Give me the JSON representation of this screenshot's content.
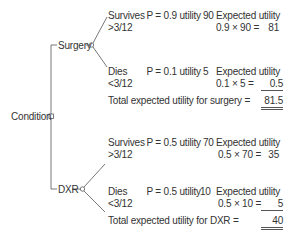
{
  "root": {
    "label": "Condition",
    "node_type": "decision-square"
  },
  "branches": [
    {
      "label": "Surgery",
      "node_type": "chance-circle",
      "outcomes": [
        {
          "label": "Survives",
          "sublabel": ">3/12",
          "probability_text": "P = 0.9 utility",
          "utility": "90",
          "eu_label": "Expected utility",
          "eu_calc": "0.9 × 90 =",
          "eu_value": "81"
        },
        {
          "label": "Dies",
          "sublabel": "<3/12",
          "probability_text": "P = 0.1 utility",
          "utility": "5",
          "eu_label": "Expected utility",
          "eu_calc": "0.1 × 5 =",
          "eu_value": "0.5"
        }
      ],
      "total_label": "Total expected utility for surgery =",
      "total_value": "81.5"
    },
    {
      "label": "DXR",
      "node_type": "chance-circle",
      "outcomes": [
        {
          "label": "Survives",
          "sublabel": ">3/12",
          "probability_text": "P = 0.5 utility",
          "utility": "70",
          "eu_label": "Expected utility",
          "eu_calc": "0.5 × 70 =",
          "eu_value": "35"
        },
        {
          "label": "Dies",
          "sublabel": "<3/12",
          "probability_text": "P = 0.5 utility",
          "utility": "10",
          "eu_label": "Expected utility",
          "eu_calc": "0.5 × 10 =",
          "eu_value": "5"
        }
      ],
      "total_label": "Total expected utility for DXR =",
      "total_value": "40"
    }
  ],
  "colors": {
    "text": "#333333",
    "line": "#555555",
    "background": "#ffffff"
  }
}
